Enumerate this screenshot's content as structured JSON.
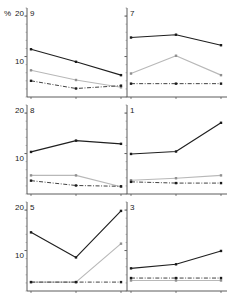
{
  "figure": {
    "axis_unit_label": "%",
    "panel_order": [
      "9",
      "7",
      "8",
      "1",
      "5",
      "3"
    ]
  },
  "chart_data": {
    "type": "line",
    "title": "",
    "subtitle": "",
    "xlabel": "",
    "ylabel": "%",
    "ylim": [
      0,
      22
    ],
    "yticks": [
      10,
      20
    ],
    "ytick_labels": [
      "10",
      "20"
    ],
    "x": [
      1,
      2,
      3
    ],
    "xtick_labels": [
      "",
      "",
      ""
    ],
    "grid": false,
    "legend": "none",
    "series_styles": [
      {
        "name": "series-solid-dark",
        "color": "#1f1f1f",
        "dash": "solid",
        "marker": "square"
      },
      {
        "name": "series-solid-light",
        "color": "#b8b8b8",
        "dash": "solid",
        "marker": "square"
      },
      {
        "name": "series-dashdot",
        "color": "#2b2b2b",
        "dash": "dashdot",
        "marker": "square"
      }
    ],
    "panels": [
      {
        "label": "9",
        "position": "top-left",
        "series": [
          {
            "name": "series-solid-dark",
            "values": [
              11.8,
              8.7,
              5.4
            ]
          },
          {
            "name": "series-solid-light",
            "values": [
              6.6,
              4.2,
              2.4
            ]
          },
          {
            "name": "series-dashdot",
            "values": [
              4.0,
              2.1,
              2.8
            ]
          }
        ]
      },
      {
        "label": "7",
        "position": "top-right",
        "series": [
          {
            "name": "series-solid-dark",
            "values": [
              14.7,
              15.4,
              12.8
            ]
          },
          {
            "name": "series-solid-light",
            "values": [
              5.8,
              10.2,
              5.4
            ]
          },
          {
            "name": "series-dashdot",
            "values": [
              3.3,
              3.3,
              3.3
            ]
          }
        ]
      },
      {
        "label": "8",
        "position": "middle-left",
        "series": [
          {
            "name": "series-solid-dark",
            "values": [
              10.4,
              13.2,
              12.4
            ]
          },
          {
            "name": "series-solid-light",
            "values": [
              4.6,
              4.6,
              1.8
            ]
          },
          {
            "name": "series-dashdot",
            "values": [
              3.3,
              2.1,
              1.9
            ]
          }
        ]
      },
      {
        "label": "1",
        "position": "middle-right",
        "series": [
          {
            "name": "series-solid-dark",
            "values": [
              9.9,
              10.5,
              17.6
            ]
          },
          {
            "name": "series-solid-light",
            "values": [
              3.4,
              3.9,
              4.6
            ]
          },
          {
            "name": "series-dashdot",
            "values": [
              3.0,
              2.7,
              2.7
            ]
          }
        ]
      },
      {
        "label": "5",
        "position": "bottom-left",
        "series": [
          {
            "name": "series-solid-dark",
            "values": [
              14.5,
              8.3,
              19.8
            ]
          },
          {
            "name": "series-solid-light",
            "values": [
              2.2,
              2.2,
              11.7
            ]
          },
          {
            "name": "series-dashdot",
            "values": [
              2.2,
              2.2,
              2.2
            ]
          }
        ]
      },
      {
        "label": "3",
        "position": "bottom-right",
        "series": [
          {
            "name": "series-solid-dark",
            "values": [
              5.6,
              6.6,
              9.9
            ]
          },
          {
            "name": "series-solid-light",
            "values": [
              2.6,
              2.6,
              2.6
            ]
          },
          {
            "name": "series-dashdot",
            "values": [
              3.2,
              3.2,
              3.2
            ]
          }
        ]
      }
    ]
  }
}
